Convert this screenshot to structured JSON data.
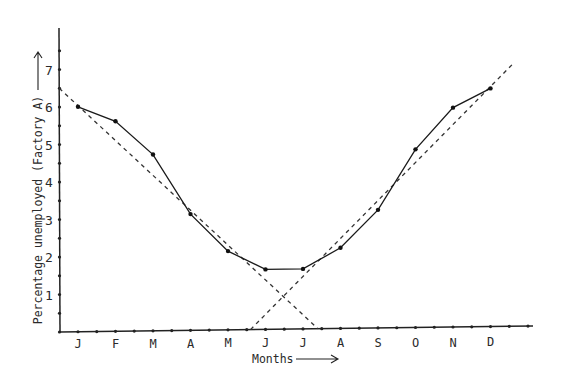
{
  "chart_data": {
    "type": "line",
    "title": "",
    "xlabel": "Months",
    "ylabel": "Percentage unemployed (Factory A)",
    "categories": [
      "J",
      "F",
      "M",
      "A",
      "M",
      "J",
      "J",
      "A",
      "S",
      "O",
      "N",
      "D"
    ],
    "ylim": [
      0,
      7.5
    ],
    "y_ticks": [
      1,
      2,
      3,
      4,
      5,
      6,
      7
    ],
    "y_minor_tick_step": 0.5,
    "grid": false,
    "legend": "none",
    "series": [
      {
        "name": "Percentage unemployed",
        "style": "solid-with-points",
        "values": [
          6.0,
          5.6,
          4.7,
          3.1,
          2.1,
          1.6,
          1.6,
          2.15,
          3.15,
          4.75,
          5.85,
          6.35
        ]
      }
    ],
    "trend_lines": [
      {
        "name": "Falling trend (Jan–Jun)",
        "style": "dashed",
        "points": [
          {
            "month_index": -0.5,
            "value": 6.5
          },
          {
            "month_index": 6.4,
            "value": 0
          }
        ]
      },
      {
        "name": "Rising trend (Jun–Dec)",
        "style": "dashed",
        "points": [
          {
            "month_index": 4.6,
            "value": 0
          },
          {
            "month_index": 11.6,
            "value": 7.0
          }
        ]
      }
    ]
  }
}
